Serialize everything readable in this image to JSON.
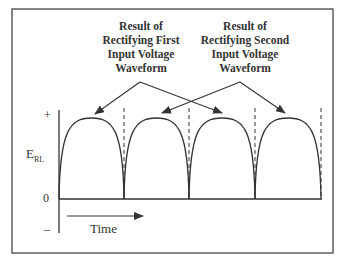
{
  "annotations": {
    "first": {
      "line1": "Result of",
      "line2": "Rectifying First",
      "line3": "Input Voltage",
      "line4": "Waveform"
    },
    "second": {
      "line1": "Result of",
      "line2": "Rectifying Second",
      "line3": "Input Voltage",
      "line4": "Waveform"
    }
  },
  "axis": {
    "y_label": "E",
    "y_label_sub": "RL",
    "plus": "+",
    "zero": "0",
    "minus": "–",
    "x_label": "Time"
  },
  "waveform": {
    "type": "full-wave rectified",
    "humps": 4,
    "hump_sources": [
      "first",
      "second",
      "first",
      "second"
    ]
  }
}
